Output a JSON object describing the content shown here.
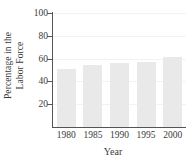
{
  "chart_data": {
    "type": "bar",
    "title": "",
    "categories": [
      "1980",
      "1985",
      "1990",
      "1995",
      "2000"
    ],
    "values": [
      51,
      54,
      56,
      57,
      61
    ],
    "xlabel": "Year",
    "ylabel_lines": [
      "Percentage in the",
      "Labor Force"
    ],
    "ylabel": "Percentage in the Labor Force",
    "ylim": [
      0,
      100
    ],
    "yticks": [
      20,
      40,
      60,
      80,
      100
    ],
    "ytick_labels": [
      "20",
      "40",
      "60",
      "80",
      "100"
    ],
    "grid": true,
    "legend": null,
    "colors": {
      "bar_fill": "#e9e9e9",
      "axis": "#555555",
      "grid": "#f2f2f2",
      "text": "#3a3a3a",
      "background": "#ffffff"
    }
  }
}
